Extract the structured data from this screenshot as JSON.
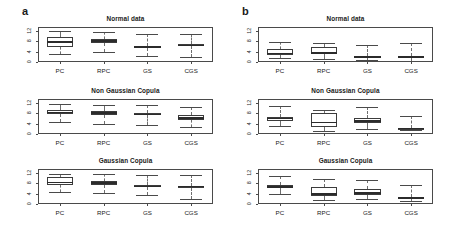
{
  "figure": {
    "panels": [
      {
        "letter": "a"
      },
      {
        "letter": "b"
      }
    ]
  },
  "chart_data": [
    {
      "type": "boxplot",
      "panel": "a",
      "title": "Normal data",
      "xlabel": "",
      "ylabel": "",
      "categories": [
        "PC",
        "RPC",
        "GS",
        "CGS"
      ],
      "yticks": [
        0,
        4,
        8,
        12
      ],
      "ylim": [
        0,
        13.5
      ],
      "grid": false,
      "legend": "none",
      "boxes": [
        {
          "category": "PC",
          "min": 3.1,
          "q1": 5.8,
          "median": 7.8,
          "q3": 9.6,
          "max": 11.9
        },
        {
          "category": "RPC",
          "min": 4.0,
          "q1": 7.4,
          "median": 8.2,
          "q3": 8.9,
          "max": 11.7
        },
        {
          "category": "GS",
          "min": 2.2,
          "q1": 5.4,
          "median": 5.8,
          "q3": 6.2,
          "max": 10.7
        },
        {
          "category": "CGS",
          "min": 2.1,
          "q1": 6.0,
          "median": 6.4,
          "q3": 6.8,
          "max": 10.9
        }
      ]
    },
    {
      "type": "boxplot",
      "panel": "a",
      "title": "Non Gaussian Copula",
      "xlabel": "",
      "ylabel": "",
      "categories": [
        "PC",
        "RPC",
        "GS",
        "CGS"
      ],
      "yticks": [
        0,
        4,
        8,
        12
      ],
      "ylim": [
        0,
        13.5
      ],
      "grid": false,
      "legend": "none",
      "boxes": [
        {
          "category": "PC",
          "min": 4.6,
          "q1": 7.6,
          "median": 8.4,
          "q3": 9.2,
          "max": 11.4
        },
        {
          "category": "RPC",
          "min": 3.7,
          "q1": 7.3,
          "median": 8.1,
          "q3": 9.0,
          "max": 11.3
        },
        {
          "category": "GS",
          "min": 3.6,
          "q1": 7.2,
          "median": 7.6,
          "q3": 8.0,
          "max": 11.2
        },
        {
          "category": "CGS",
          "min": 2.8,
          "q1": 5.5,
          "median": 6.2,
          "q3": 7.4,
          "max": 10.6
        }
      ]
    },
    {
      "type": "boxplot",
      "panel": "a",
      "title": "Gaussian Copula",
      "xlabel": "",
      "ylabel": "",
      "categories": [
        "PC",
        "RPC",
        "GS",
        "CGS"
      ],
      "yticks": [
        0,
        4,
        8,
        12
      ],
      "ylim": [
        0,
        13.5
      ],
      "grid": false,
      "legend": "none",
      "boxes": [
        {
          "category": "PC",
          "min": 4.8,
          "q1": 7.4,
          "median": 8.4,
          "q3": 10.3,
          "max": 11.6
        },
        {
          "category": "RPC",
          "min": 4.2,
          "q1": 7.4,
          "median": 8.1,
          "q3": 9.0,
          "max": 11.6
        },
        {
          "category": "GS",
          "min": 3.3,
          "q1": 6.4,
          "median": 6.8,
          "q3": 7.2,
          "max": 11.0
        },
        {
          "category": "CGS",
          "min": 1.9,
          "q1": 6.3,
          "median": 6.7,
          "q3": 7.1,
          "max": 11.1
        }
      ]
    },
    {
      "type": "boxplot",
      "panel": "b",
      "title": "Normal data",
      "xlabel": "",
      "ylabel": "",
      "categories": [
        "PC",
        "RPC",
        "GS",
        "CGS"
      ],
      "yticks": [
        0,
        4,
        8,
        12
      ],
      "ylim": [
        0,
        13.5
      ],
      "grid": false,
      "legend": "none",
      "boxes": [
        {
          "category": "PC",
          "min": 1.4,
          "q1": 2.6,
          "median": 3.3,
          "q3": 5.2,
          "max": 7.6
        },
        {
          "category": "RPC",
          "min": 1.3,
          "q1": 2.9,
          "median": 3.4,
          "q3": 5.6,
          "max": 7.2
        },
        {
          "category": "GS",
          "min": 0.7,
          "q1": 1.8,
          "median": 2.0,
          "q3": 2.3,
          "max": 6.7
        },
        {
          "category": "CGS",
          "min": 0.5,
          "q1": 1.7,
          "median": 2.0,
          "q3": 2.4,
          "max": 7.4
        }
      ]
    },
    {
      "type": "boxplot",
      "panel": "b",
      "title": "Non Gaussian Copula",
      "xlabel": "",
      "ylabel": "",
      "categories": [
        "PC",
        "RPC",
        "GS",
        "CGS"
      ],
      "yticks": [
        0,
        4,
        8,
        12
      ],
      "ylim": [
        0,
        13.5
      ],
      "grid": false,
      "legend": "none",
      "boxes": [
        {
          "category": "PC",
          "min": 3.1,
          "q1": 5.1,
          "median": 6.0,
          "q3": 6.7,
          "max": 10.9
        },
        {
          "category": "RPC",
          "min": 1.3,
          "q1": 2.6,
          "median": 4.4,
          "q3": 8.2,
          "max": 9.4
        },
        {
          "category": "GS",
          "min": 1.9,
          "q1": 4.2,
          "median": 5.0,
          "q3": 6.1,
          "max": 10.4
        },
        {
          "category": "CGS",
          "min": 1.4,
          "q1": 1.9,
          "median": 2.2,
          "q3": 2.5,
          "max": 6.8
        }
      ]
    },
    {
      "type": "boxplot",
      "panel": "b",
      "title": "Gaussian Copula",
      "xlabel": "",
      "ylabel": "",
      "categories": [
        "PC",
        "RPC",
        "GS",
        "CGS"
      ],
      "yticks": [
        0,
        4,
        8,
        12
      ],
      "ylim": [
        0,
        13.5
      ],
      "grid": false,
      "legend": "none",
      "boxes": [
        {
          "category": "PC",
          "min": 3.9,
          "q1": 6.1,
          "median": 6.7,
          "q3": 7.4,
          "max": 10.7
        },
        {
          "category": "RPC",
          "min": 1.7,
          "q1": 3.2,
          "median": 4.0,
          "q3": 6.5,
          "max": 9.7
        },
        {
          "category": "GS",
          "min": 1.9,
          "q1": 3.5,
          "median": 4.3,
          "q3": 5.6,
          "max": 9.1
        },
        {
          "category": "CGS",
          "min": 1.1,
          "q1": 2.0,
          "median": 2.3,
          "q3": 2.6,
          "max": 7.2
        }
      ]
    }
  ],
  "style": {
    "frame_color": "#4a4a4a",
    "box_fill_light": "#ffffff",
    "box_fill_dark": "#8e8e8e",
    "median_color": "#2b2b2b",
    "whisker_color": "#6e6e6e"
  }
}
